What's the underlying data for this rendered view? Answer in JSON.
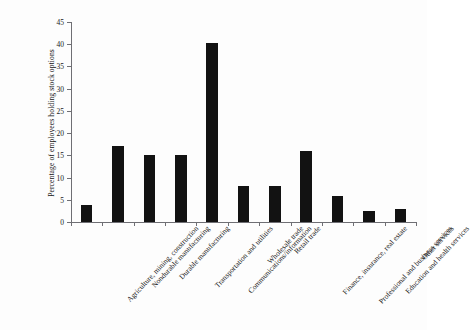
{
  "figure": {
    "top_clipped_text": "·   ·        ·   ·            ·        ·         ·",
    "background_color": "#ffffff",
    "bar_color": "#121212",
    "axis_color": "#6f6f74"
  },
  "chart_data": {
    "type": "bar",
    "title": "",
    "xlabel": "",
    "ylabel": "Percentage of employees holding stock options",
    "ylim": [
      0,
      45
    ],
    "ytick_labels": [
      "0",
      "5",
      "10",
      "15",
      "20",
      "25",
      "30",
      "35",
      "40",
      "45"
    ],
    "ytick_values": [
      0,
      5,
      10,
      15,
      20,
      25,
      30,
      35,
      40,
      45
    ],
    "grid": false,
    "legend": null,
    "categories": [
      "Agriculture, mining, construction",
      "Nondurable manufacturing",
      "Durable manufacturing",
      "Transportation and utilities",
      "Communications/information",
      "Wholesale trade",
      "Retail trade",
      "Finance, insurance, real estate",
      "Professional and business services",
      "Education and health services",
      "Other services"
    ],
    "values": [
      3.8,
      17.2,
      15.0,
      15.0,
      40.2,
      8.0,
      8.2,
      16.0,
      5.8,
      2.5,
      3.0
    ]
  }
}
